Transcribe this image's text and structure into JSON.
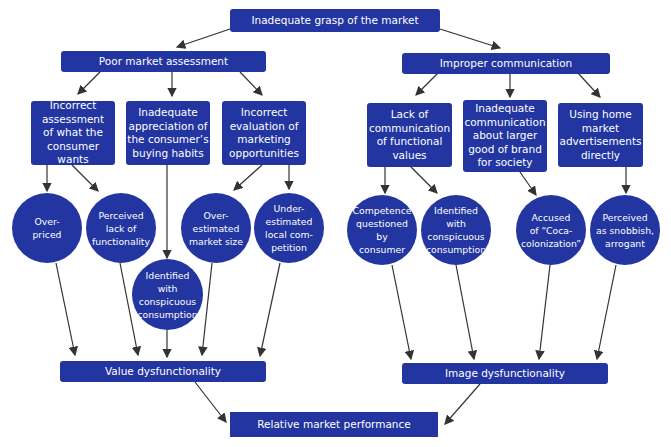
{
  "diagram": {
    "root": "Inadequate grasp of the market",
    "branches": [
      {
        "label": "Poor market assessment",
        "causes": [
          "Incorrect\nassessment\nof what the\nconsumer wants",
          "Inadequate\nappreciation of\nthe consumer’s\nbuying habits",
          "Incorrect\nevaluation of\nmarketing\nopportunities"
        ],
        "effects": [
          "Over-\npriced",
          "Perceived\nlack of\nfunctionality",
          "Identified\nwith\nconspicuous\nconsumption",
          "Over-\nestimated\nmarket size",
          "Under-\nestimated\nlocal com-\npetition"
        ],
        "outcome": "Value dysfunctionality"
      },
      {
        "label": "Improper communication",
        "causes": [
          "Lack of\ncommunication\nof functional\nvalues",
          "Inadequate\ncommunication\nabout larger\ngood of brand\nfor society",
          "Using home\nmarket\nadvertisements\ndirectly"
        ],
        "effects": [
          "Competence\nquestioned by\nconsumer",
          "Identified\nwith\nconspicuous\nconsumption",
          "Accused\nof “Coca-\ncolonization”",
          "Perceived\nas snobbish,\narrogant"
        ],
        "outcome": "Image dysfunctionality"
      }
    ],
    "final": "Relative market performance",
    "colors": {
      "node": "#2235a0",
      "arrow": "#333333"
    }
  }
}
